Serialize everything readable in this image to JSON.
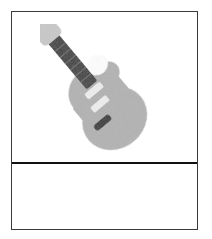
{
  "figure": {
    "panel_image": {
      "label": "guitar-illustration",
      "alt_text": "Grayscale electric guitar illustration, angled diagonally"
    },
    "panel_caption": {
      "text": ""
    },
    "colors": {
      "border": "#3a3a3a",
      "divider": "#111111",
      "background": "#ffffff",
      "body_gray": "#b2b2b2",
      "body_gray_dark": "#a3a3a3",
      "headstock_gray": "#c9c9c9",
      "neck_dark": "#3b3b3b",
      "pickup_light": "#efefef",
      "bridge_dark": "#2e2e2e"
    },
    "illustration_parts": [
      {
        "name": "guitar-body",
        "color": "#b2b2b2"
      },
      {
        "name": "guitar-cutaway-horn",
        "color": "#b2b2b2"
      },
      {
        "name": "guitar-neck",
        "color": "#3b3b3b"
      },
      {
        "name": "guitar-headstock",
        "color": "#c9c9c9"
      },
      {
        "name": "guitar-pickup-neck",
        "color": "#efefef"
      },
      {
        "name": "guitar-pickup-bridge",
        "color": "#efefef"
      },
      {
        "name": "guitar-tailpiece",
        "color": "#2e2e2e"
      }
    ]
  }
}
